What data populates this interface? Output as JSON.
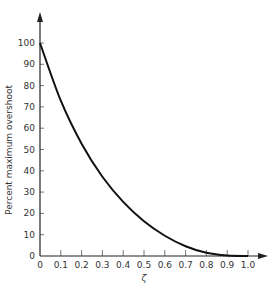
{
  "chart_data": {
    "type": "line",
    "title": "",
    "xlabel": "ζ",
    "ylabel": "Percent maximum overshoot",
    "xlim": [
      0,
      1.0
    ],
    "ylim": [
      0,
      100
    ],
    "grid": false,
    "legend": null,
    "x_ticks": [
      "0",
      "0.1",
      "0.2",
      "0.3",
      "0.4",
      "0.5",
      "0.6",
      "0.7",
      "0.8",
      "0.9",
      "1.0"
    ],
    "y_ticks": [
      "0",
      "10",
      "20",
      "30",
      "40",
      "50",
      "60",
      "70",
      "80",
      "90",
      "100"
    ],
    "series": [
      {
        "name": "Percent maximum overshoot",
        "x": [
          0,
          0.1,
          0.2,
          0.3,
          0.4,
          0.5,
          0.6,
          0.7,
          0.8,
          0.9,
          1.0
        ],
        "values": [
          100,
          72.9,
          52.7,
          37.2,
          25.4,
          16.3,
          9.5,
          4.6,
          1.5,
          0.2,
          0
        ]
      }
    ]
  }
}
